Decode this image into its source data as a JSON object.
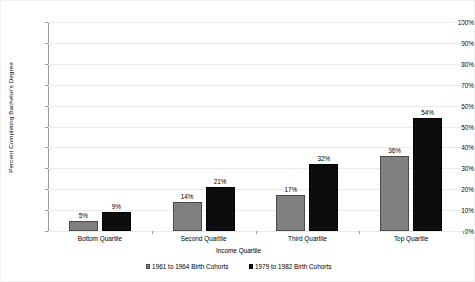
{
  "chart_data": {
    "type": "bar",
    "title": "",
    "xlabel": "Income Quartile",
    "ylabel": "Percent Completing Bachelor's Degree",
    "categories": [
      "Bottom Quartile",
      "Second Quartile",
      "Third Quartile",
      "Top Quartile"
    ],
    "series": [
      {
        "name": "1961 to 1964 Birth Cohorts",
        "color": "#808080",
        "values": [
          5,
          14,
          17,
          36
        ],
        "labels": [
          "5%",
          "14%",
          "17%",
          "36%"
        ]
      },
      {
        "name": "1979 to 1982 Birth Cohorts",
        "color": "#0d0d0d",
        "values": [
          9,
          21,
          32,
          54
        ],
        "labels": [
          "9%",
          "21%",
          "32%",
          "54%"
        ]
      }
    ],
    "ylim": [
      0,
      100
    ],
    "ytick_values": [
      0,
      10,
      20,
      30,
      40,
      50,
      60,
      70,
      80,
      90,
      100
    ],
    "ytick_labels": [
      "0%",
      "10%",
      "20%",
      "30%",
      "40%",
      "50%",
      "60%",
      "70%",
      "80%",
      "90%",
      "100%"
    ],
    "grid": true,
    "legend_position": "bottom",
    "value_labels": true
  },
  "legend": {
    "items": [
      {
        "label": "1961 to 1964 Birth Cohorts",
        "swatch": "series-a"
      },
      {
        "label": "1979 to 1982 Birth Cohorts",
        "swatch": "series-b"
      }
    ]
  }
}
